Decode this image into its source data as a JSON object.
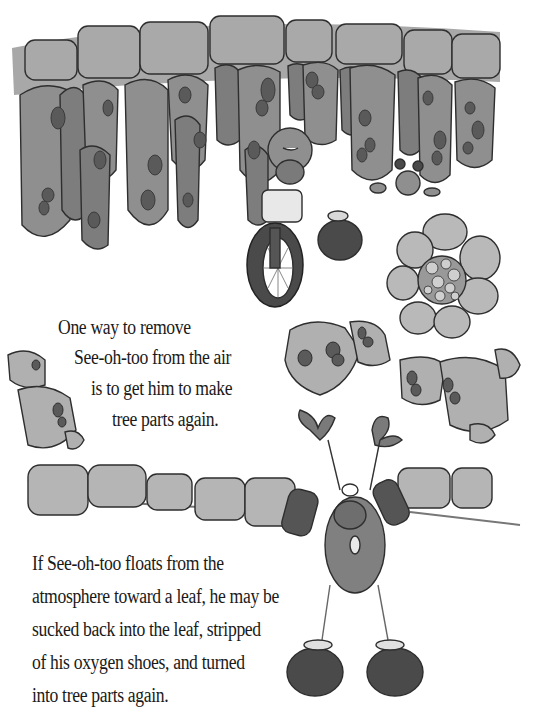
{
  "page": {
    "type": "illustrated-book-page",
    "illustration": {
      "subject": "leaf cross-section with cartoon See-oh-too characters",
      "elements": [
        "upper-epidermis",
        "palisade-cells",
        "vascular-bundle",
        "spongy-cells",
        "lower-epidermis",
        "stoma-guard-cells",
        "character-on-bicycle",
        "small-character",
        "character-with-oxygen-shoes"
      ],
      "palette": {
        "cell_fill": "#8f8f8f",
        "cell_light": "#b9b9b9",
        "nucleus": "#5a5a5a",
        "outline": "#2e2e2e",
        "dark": "#4a4a4a"
      }
    },
    "passage_1": {
      "lines": [
        "One way to remove",
        "See-oh-too from the air",
        "is to get him to make",
        "tree parts again."
      ]
    },
    "passage_2": {
      "lines": [
        "If See-oh-too floats from the",
        "atmosphere toward a leaf, he may be",
        "sucked back into the leaf, stripped",
        "of his oxygen shoes, and turned",
        "into tree parts again."
      ]
    }
  }
}
